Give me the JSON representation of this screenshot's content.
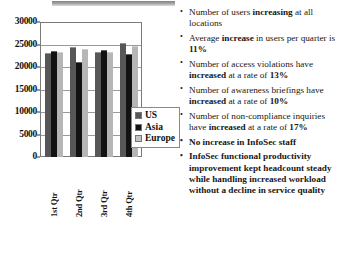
{
  "slide": {
    "chart_title": "",
    "legend_position": "inside-right"
  },
  "chart_data": {
    "type": "bar",
    "title": "",
    "xlabel": "",
    "ylabel": "",
    "categories": [
      "1st Qtr",
      "2nd Qtr",
      "3rd Qtr",
      "4th Qtr"
    ],
    "series": [
      {
        "name": "US",
        "color": "#575757",
        "values": [
          23200,
          24500,
          23400,
          25300
        ]
      },
      {
        "name": "Asia",
        "color": "#121212",
        "values": [
          23500,
          21200,
          23800,
          22800
        ]
      },
      {
        "name": "Europe",
        "color": "#b6b6b6",
        "values": [
          23300,
          23900,
          23400,
          24600
        ]
      }
    ],
    "ylim": [
      0,
      30000
    ],
    "ytick_values": [
      30000,
      25000,
      20000,
      15000,
      10000,
      5000,
      0
    ],
    "ytick_labels": [
      "30000",
      "25000",
      "20000",
      "15000",
      "10000",
      "5000",
      "0"
    ],
    "grid": true,
    "legend": [
      "US",
      "Asia",
      "Europe"
    ],
    "legend_position": "right"
  },
  "bullets": [
    {
      "id": "users-increasing",
      "bold_all": false,
      "parts": [
        {
          "text": "Number of users ",
          "bold": false
        },
        {
          "text": "increasing",
          "bold": true
        },
        {
          "text": " at all locations",
          "bold": false
        }
      ]
    },
    {
      "id": "average-increase",
      "bold_all": false,
      "parts": [
        {
          "text": "Average ",
          "bold": false
        },
        {
          "text": "increase",
          "bold": true
        },
        {
          "text": " in users per quarter is ",
          "bold": false
        },
        {
          "text": "11%",
          "bold": true
        }
      ]
    },
    {
      "id": "access-violations",
      "bold_all": false,
      "parts": [
        {
          "text": "Number of access violations have ",
          "bold": false
        },
        {
          "text": "increased",
          "bold": true
        },
        {
          "text": " at a rate of ",
          "bold": false
        },
        {
          "text": "13%",
          "bold": true
        }
      ]
    },
    {
      "id": "awareness-briefings",
      "bold_all": false,
      "parts": [
        {
          "text": "Number of awareness briefings have ",
          "bold": false
        },
        {
          "text": "increased",
          "bold": true
        },
        {
          "text": " at a rate of ",
          "bold": false
        },
        {
          "text": "10%",
          "bold": true
        }
      ]
    },
    {
      "id": "non-compliance-inquiries",
      "bold_all": false,
      "parts": [
        {
          "text": "Number of non-compliance inquiries have ",
          "bold": false
        },
        {
          "text": "increased",
          "bold": true
        },
        {
          "text": " at a rate of ",
          "bold": false
        },
        {
          "text": "17%",
          "bold": true
        }
      ]
    },
    {
      "id": "no-increase-staff",
      "bold_all": true,
      "parts": [
        {
          "text": "No increase in InfoSec staff",
          "bold": true
        }
      ]
    },
    {
      "id": "infosec-productivity",
      "bold_all": true,
      "parts": [
        {
          "text": "InfoSec functional productivity improvement kept headcount steady while handling increased workload without a decline in service quality",
          "bold": true
        }
      ]
    }
  ]
}
